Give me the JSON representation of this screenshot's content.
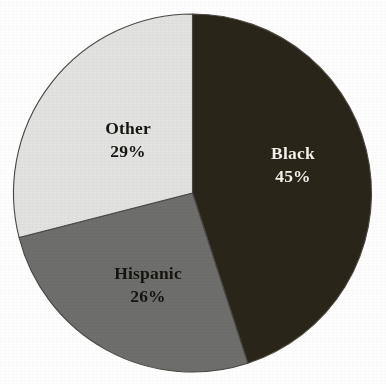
{
  "chart_data": {
    "type": "pie",
    "title": "",
    "subtitle": "",
    "xlabel": "",
    "ylabel": "",
    "legend_position": "none",
    "grid": false,
    "labels_inside_slices": true,
    "categories": [
      "Black",
      "Hispanic",
      "Other"
    ],
    "values": [
      45,
      26,
      29
    ],
    "value_unit": "%",
    "start_angle_deg": 0,
    "direction": "clockwise",
    "slices": [
      {
        "label": "Black",
        "value": 45,
        "value_text": "45%",
        "color": "#2a2519",
        "text_color": "#f4f2ec",
        "start_angle_deg": 0,
        "end_angle_deg": 162
      },
      {
        "label": "Hispanic",
        "value": 26,
        "value_text": "26%",
        "color": "#6e6e6c",
        "text_color": "#15130e",
        "start_angle_deg": 162,
        "end_angle_deg": 255.6
      },
      {
        "label": "Other",
        "value": 29,
        "value_text": "29%",
        "color": "#e2e2e0",
        "text_color": "#17150f",
        "start_angle_deg": 255.6,
        "end_angle_deg": 360
      }
    ],
    "geometry": {
      "center_x": 192.5,
      "center_y": 193,
      "radius": 179,
      "outline_color": "#4a4742",
      "background_color": "#fefefe"
    }
  },
  "labels": {
    "black": {
      "name": "Black",
      "value": "45%"
    },
    "hispanic": {
      "name": "Hispanic",
      "value": "26%"
    },
    "other": {
      "name": "Other",
      "value": "29%"
    }
  }
}
